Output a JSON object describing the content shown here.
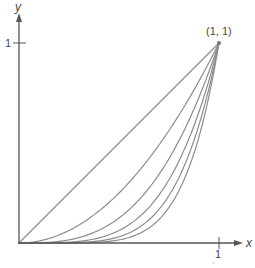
{
  "diagram": {
    "title": "",
    "axes": {
      "x_label": "x",
      "y_label": "y",
      "x_tick_label": "1",
      "y_tick_label": "1"
    },
    "point_label": "(1, 1)",
    "curves": [
      {
        "name": "y = x",
        "power": 1
      },
      {
        "name": "y = x^2",
        "power": 2
      },
      {
        "name": "y = x^3",
        "power": 3
      },
      {
        "name": "y = x^4",
        "power": 4
      },
      {
        "name": "y = x^5",
        "power": 5
      },
      {
        "name": "y = x^6",
        "power": 6
      }
    ],
    "colors": {
      "axis": "#555555",
      "curve": "#8c8c8c",
      "text": "#4a4a4a"
    }
  },
  "chart_data": {
    "type": "line",
    "title": "",
    "xlabel": "x",
    "ylabel": "y",
    "xlim": [
      0,
      1
    ],
    "ylim": [
      0,
      1
    ],
    "x_ticks": [
      "1"
    ],
    "y_ticks": [
      "1"
    ],
    "annotations": [
      {
        "text": "(1, 1)",
        "x": 1,
        "y": 1
      }
    ],
    "series": [
      {
        "name": "x^1",
        "power": 1
      },
      {
        "name": "x^2",
        "power": 2
      },
      {
        "name": "x^3",
        "power": 3
      },
      {
        "name": "x^4",
        "power": 4
      },
      {
        "name": "x^5",
        "power": 5
      },
      {
        "name": "x^6",
        "power": 6
      }
    ]
  }
}
